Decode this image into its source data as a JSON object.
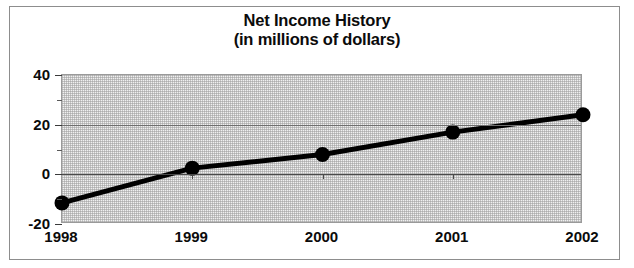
{
  "chart_data": {
    "type": "line",
    "title": "Net Income History",
    "subtitle": "(in millions of dollars)",
    "xlabel": "",
    "ylabel": "",
    "categories": [
      "1998",
      "1999",
      "2000",
      "2001",
      "2002"
    ],
    "values": [
      -11.5,
      2.5,
      8,
      17,
      24
    ],
    "series": [
      {
        "name": "Net Income",
        "values": [
          -11.5,
          2.5,
          8,
          17,
          24
        ]
      }
    ],
    "ylim": [
      -20,
      40
    ],
    "xlim": [
      "1998",
      "2002"
    ],
    "y_major_ticks": [
      40,
      20,
      0,
      -20
    ],
    "y_tick_labels": [
      "40",
      "20",
      "0",
      "-20"
    ],
    "y_minor_ticks": [
      30,
      10,
      -10
    ],
    "gridlines": [
      20,
      0
    ],
    "grid": true,
    "legend": null,
    "legend_position": "none",
    "marker": "filled-circle",
    "line_color": "#000000",
    "marker_color": "#000000",
    "plot_background": "#f0f0f0",
    "frame_color": "#8d8d8d"
  },
  "title_block": {
    "line1": "Net Income History",
    "line2": "(in millions of dollars)"
  },
  "axis": {
    "y_labels": [
      "40",
      "20",
      "0",
      "-20"
    ],
    "x_labels": [
      "1998",
      "1999",
      "2000",
      "2001",
      "2002"
    ]
  }
}
